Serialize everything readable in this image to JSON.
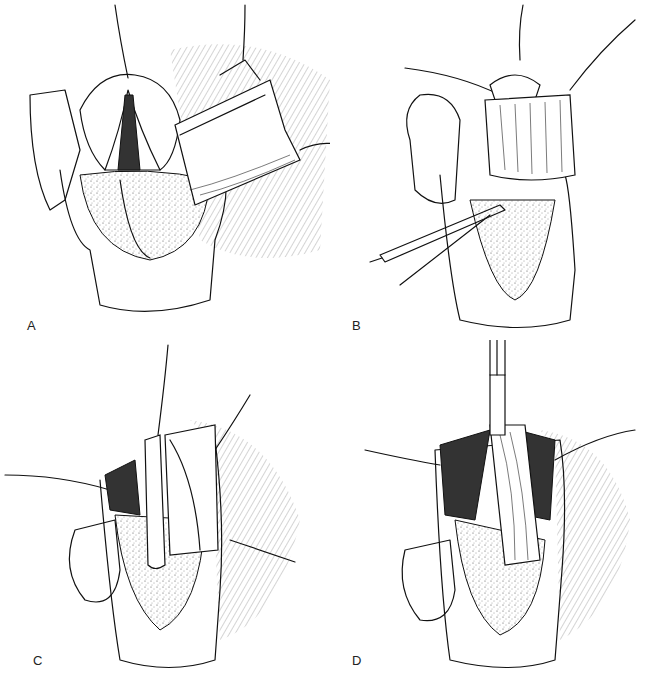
{
  "figure": {
    "panels": [
      {
        "id": "A",
        "label": "A",
        "description": "Opened structure with a flap reflected to the right; sutures placed at apex and flap"
      },
      {
        "id": "B",
        "label": "B",
        "description": "Flap advanced across the opening, held by forceps; traction sutures at top"
      },
      {
        "id": "C",
        "label": "C",
        "description": "Tube in place within the lumen; flap being sutured over it with lateral stay sutures"
      },
      {
        "id": "D",
        "label": "D",
        "description": "Flap closed over the tube with running closure; lateral stay sutures"
      }
    ]
  }
}
